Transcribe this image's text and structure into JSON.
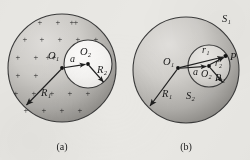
{
  "figure": {
    "background_color": "#e9e8e4",
    "sphere_fill_light": "#d8d6d2",
    "sphere_fill_dark": "#9b9a97",
    "cavity_fill": "#f4f3f1",
    "inner_sphere_fill_light": "#e2e0dd",
    "inner_sphere_fill_dark": "#b4b2ae",
    "stroke_color": "#2a2a2a",
    "charge_symbol": "+",
    "charge_symbol_name": "plus-charge-marker",
    "charge_count": 24
  },
  "panel_a": {
    "caption": "(a)",
    "outer_sphere": {
      "name": "uniformly-charged-sphere",
      "center_label": "O",
      "center_subscript": "1",
      "radius_label": "R",
      "radius_subscript": "1"
    },
    "cavity": {
      "name": "spherical-cavity",
      "center_label": "O",
      "center_subscript": "2",
      "radius_label": "R",
      "radius_subscript": "2"
    },
    "offset_label": "a",
    "labels": {
      "o1": "O₁",
      "o2": "O₂",
      "r1": "R₁",
      "r2": "R₂",
      "a": "a"
    }
  },
  "panel_b": {
    "caption": "(b)",
    "outer_sphere": {
      "name": "sphere-s1",
      "surface_label": "S",
      "surface_subscript": "1",
      "center_label": "O",
      "center_subscript": "1",
      "radius_label": "R",
      "radius_subscript": "1"
    },
    "inner_sphere": {
      "name": "sphere-s2",
      "surface_label": "S",
      "surface_subscript": "2",
      "center_label": "O",
      "center_subscript": "2",
      "radius_label": "R",
      "radius_subscript": "2"
    },
    "field_point": {
      "name": "field-point-p",
      "label": "P"
    },
    "vectors": {
      "r1_label": "r",
      "r1_subscript": "1",
      "r2_label": "r",
      "r2_subscript": "2"
    },
    "offset_label": "a",
    "labels": {
      "s1": "S₁",
      "s2": "S₂",
      "o1": "O₁",
      "o2": "O₂",
      "r1_cap": "R₁",
      "r2_cap": "R₂",
      "r1_vec": "r₁",
      "r2_vec": "r₂",
      "a": "a",
      "p": "P"
    }
  }
}
